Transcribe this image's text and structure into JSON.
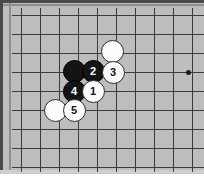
{
  "diagram": {
    "kind": "go-board-diagram",
    "board_color": "#bdbdbd",
    "line_color": "#3b3b3b",
    "frame_color": "#4a4a4a",
    "black_stone_color": "#141414",
    "white_stone_color": "#fcfcfc",
    "stone_diameter": 23,
    "grid": {
      "cell_size": 19,
      "vertical_lines_x": [
        21,
        40,
        59,
        78,
        97,
        116,
        135,
        154,
        173,
        192
      ],
      "horizontal_lines_y": [
        15,
        34,
        53,
        72,
        91,
        110,
        129,
        148,
        167
      ],
      "star_points": [
        {
          "x": 188,
          "y": 72
        }
      ]
    },
    "stones": [
      {
        "id": "white-unnumbered-top",
        "color": "white",
        "label": "",
        "x": 112,
        "y": 51
      },
      {
        "id": "black-unnumbered-left",
        "color": "black",
        "label": "",
        "x": 74,
        "y": 71
      },
      {
        "id": "move-2",
        "color": "black",
        "label": "2",
        "x": 93,
        "y": 71
      },
      {
        "id": "move-3",
        "color": "white",
        "label": "3",
        "x": 113,
        "y": 72
      },
      {
        "id": "move-4",
        "color": "black",
        "label": "4",
        "x": 74,
        "y": 91
      },
      {
        "id": "move-1",
        "color": "white",
        "label": "1",
        "x": 93,
        "y": 91
      },
      {
        "id": "white-unnumbered-bottom",
        "color": "white",
        "label": "",
        "x": 55,
        "y": 110
      },
      {
        "id": "move-5",
        "color": "white",
        "label": "5",
        "x": 74,
        "y": 110
      }
    ]
  }
}
